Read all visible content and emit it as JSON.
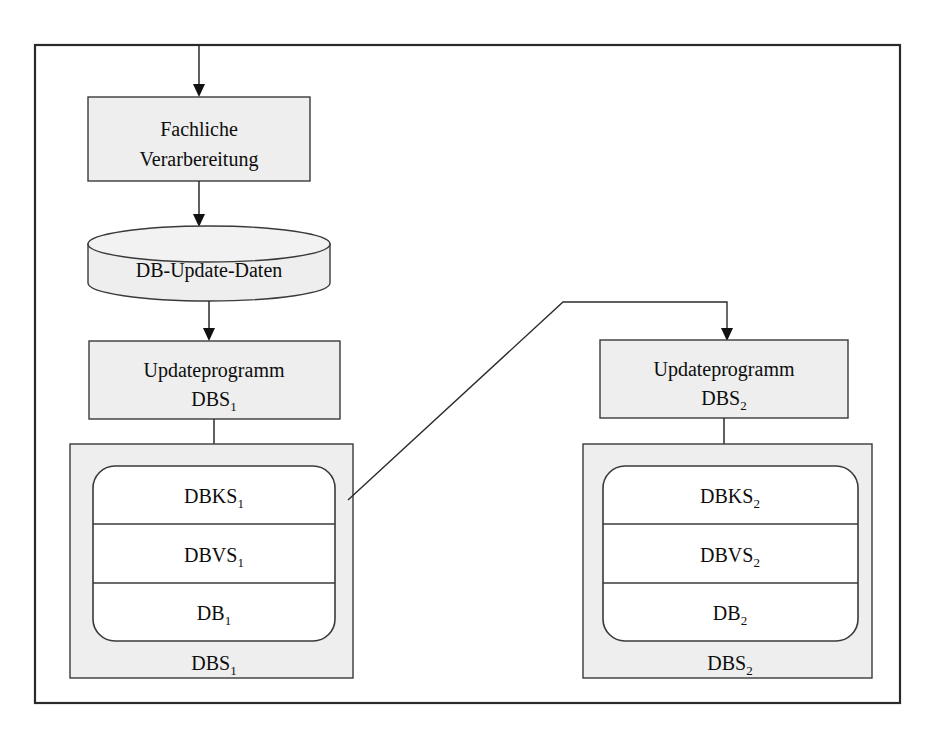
{
  "diagram": {
    "frame": {
      "name": "outer-frame"
    },
    "colors": {
      "node_fill": "#eeeeee",
      "panel_fill": "#ffffff",
      "stroke": "#3a3a3a",
      "frame_stroke": "#2a2a2a",
      "arrow": "#111111",
      "text": "#0d0d0d"
    },
    "nodes": {
      "process": {
        "line1": "Fachliche",
        "line2": "Verarbereitung"
      },
      "datastore": {
        "label": "DB-Update-Daten"
      },
      "update_program_1": {
        "line1": "Updateprogramm",
        "line2_base": "DBS",
        "line2_sub": "1"
      },
      "update_program_2": {
        "line1": "Updateprogramm",
        "line2_base": "DBS",
        "line2_sub": "2"
      },
      "dbs_1": {
        "container_base": "DBS",
        "container_sub": "1",
        "layers": [
          {
            "base": "DBKS",
            "sub": "1"
          },
          {
            "base": "DBVS",
            "sub": "1"
          },
          {
            "base": "DB",
            "sub": "1"
          }
        ]
      },
      "dbs_2": {
        "container_base": "DBS",
        "container_sub": "2",
        "layers": [
          {
            "base": "DBKS",
            "sub": "2"
          },
          {
            "base": "DBVS",
            "sub": "2"
          },
          {
            "base": "DB",
            "sub": "2"
          }
        ]
      }
    },
    "connectors": [
      {
        "name": "input-to-process",
        "kind": "arrow",
        "direction": "down"
      },
      {
        "name": "process-to-datastore",
        "kind": "arrow",
        "direction": "down"
      },
      {
        "name": "datastore-to-updateprogram-1",
        "kind": "arrow",
        "direction": "down"
      },
      {
        "name": "updateprogram-1-to-dbs-1",
        "kind": "arrow",
        "direction": "down"
      },
      {
        "name": "dbks-1-to-updateprogram-2",
        "kind": "arrow",
        "direction": "diagonal-then-down"
      },
      {
        "name": "updateprogram-2-to-dbs-2",
        "kind": "arrow",
        "direction": "down"
      }
    ]
  }
}
